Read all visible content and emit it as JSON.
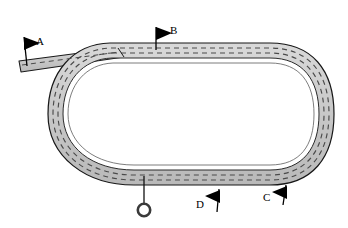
{
  "diagram": {
    "canvas": {
      "width": 348,
      "height": 228,
      "background": "#ffffff"
    },
    "colors": {
      "road_fill": "#c9c9c9",
      "road_fill_light": "#d8d8d8",
      "road_outline": "#1a1a1a",
      "lane_dash": "#4a4a4a",
      "flag_fill": "#000000",
      "label_text": "#000000",
      "marker_stroke": "#3a3a3a",
      "page_background": "#ffffff"
    },
    "shapes": {
      "track": {
        "name": "oval-loop-road",
        "type": "closed-oval-road"
      },
      "branch": {
        "name": "branch-road-stub",
        "type": "straight-road-segment"
      },
      "lane_lines": {
        "name": "dashed-lane-markings",
        "dash_pattern": "5 4"
      },
      "circle_marker": {
        "name": "ring-marker",
        "cx": 144,
        "cy": 210,
        "r": 6.5
      },
      "leader_line": {
        "name": "marker-leader-line",
        "x": 144,
        "y1": 176,
        "y2": 203
      }
    },
    "flags": [
      {
        "id": "A",
        "label": "A",
        "direction": "right",
        "label_x": 36,
        "label_y": 36,
        "pole_x": 24,
        "pole_y_top": 37,
        "pole_y_bottom": 66,
        "tri_x": 24,
        "tri_y": 38
      },
      {
        "id": "B",
        "label": "B",
        "direction": "right",
        "label_x": 170,
        "label_y": 26,
        "pole_x": 156,
        "pole_y_top": 27,
        "pole_y_bottom": 50,
        "tri_x": 156,
        "tri_y": 28
      },
      {
        "id": "C",
        "label": "C",
        "direction": "left",
        "label_x": 263,
        "label_y": 194,
        "pole_x": 285,
        "pole_y_top": 185,
        "pole_y_bottom": 204,
        "tri_x": 285,
        "tri_y": 186
      },
      {
        "id": "D",
        "label": "D",
        "direction": "left",
        "label_x": 196,
        "label_y": 203,
        "pole_x": 218,
        "pole_y_top": 190,
        "pole_y_bottom": 212,
        "tri_x": 218,
        "tri_y": 191
      }
    ]
  }
}
